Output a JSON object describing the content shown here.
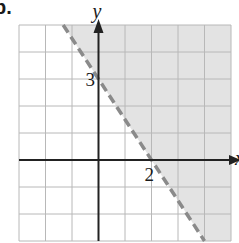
{
  "problem": {
    "label": "b."
  },
  "chart_data": {
    "type": "inequality-graph",
    "title": "",
    "xlabel": "x",
    "ylabel": "y",
    "xlim": [
      -3,
      5
    ],
    "ylim": [
      -3,
      5
    ],
    "grid": true,
    "grid_step": 1,
    "boundary_line": {
      "equation": "y = -3/2 x + 3",
      "style": "dashed",
      "points": [
        [
          0,
          3
        ],
        [
          2,
          0
        ]
      ],
      "x_intercept": 2,
      "y_intercept": 3
    },
    "inequality": "3x + 2y > 6",
    "shaded_region": "above/right of line",
    "annotations": [
      {
        "text": "3",
        "x": 0,
        "y": 3,
        "meaning": "y-intercept"
      },
      {
        "text": "2",
        "x": 2,
        "y": 0,
        "meaning": "x-intercept"
      }
    ]
  },
  "labels": {
    "x_axis": "x",
    "y_axis": "y",
    "y_intercept": "3",
    "x_intercept": "2"
  },
  "colors": {
    "shade": "#e3e3e3",
    "grid": "#b8b8b8",
    "axis": "#222222",
    "boundary": "#8a8a8a"
  }
}
